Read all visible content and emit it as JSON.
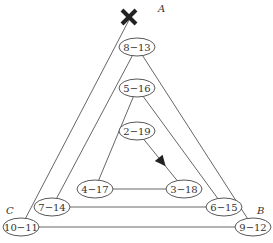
{
  "diagram": {
    "corners": {
      "A": "A",
      "B": "B",
      "C": "C"
    },
    "start_marker": "cross-icon",
    "nodes": [
      {
        "id": "n8_13",
        "label": "8−13"
      },
      {
        "id": "n5_16",
        "label": "5−16"
      },
      {
        "id": "n2_19",
        "label": "2−19"
      },
      {
        "id": "n4_17",
        "label": "4−17"
      },
      {
        "id": "n3_18",
        "label": "3−18"
      },
      {
        "id": "n7_14",
        "label": "7−14"
      },
      {
        "id": "n6_15",
        "label": "6−15"
      },
      {
        "id": "n10_11",
        "label": "10−11"
      },
      {
        "id": "n9_12",
        "label": "9−12"
      }
    ],
    "edges": [
      {
        "from": "start",
        "to": "n10_11"
      },
      {
        "from": "n10_11",
        "to": "n9_12"
      },
      {
        "from": "n8_13",
        "to": "n9_12"
      },
      {
        "from": "n8_13",
        "to": "n7_14"
      },
      {
        "from": "n7_14",
        "to": "n6_15"
      },
      {
        "from": "n5_16",
        "to": "n6_15"
      },
      {
        "from": "n5_16",
        "to": "n4_17"
      },
      {
        "from": "n4_17",
        "to": "n3_18"
      },
      {
        "from": "n2_19",
        "to": "n3_18",
        "arrow": true
      }
    ]
  }
}
